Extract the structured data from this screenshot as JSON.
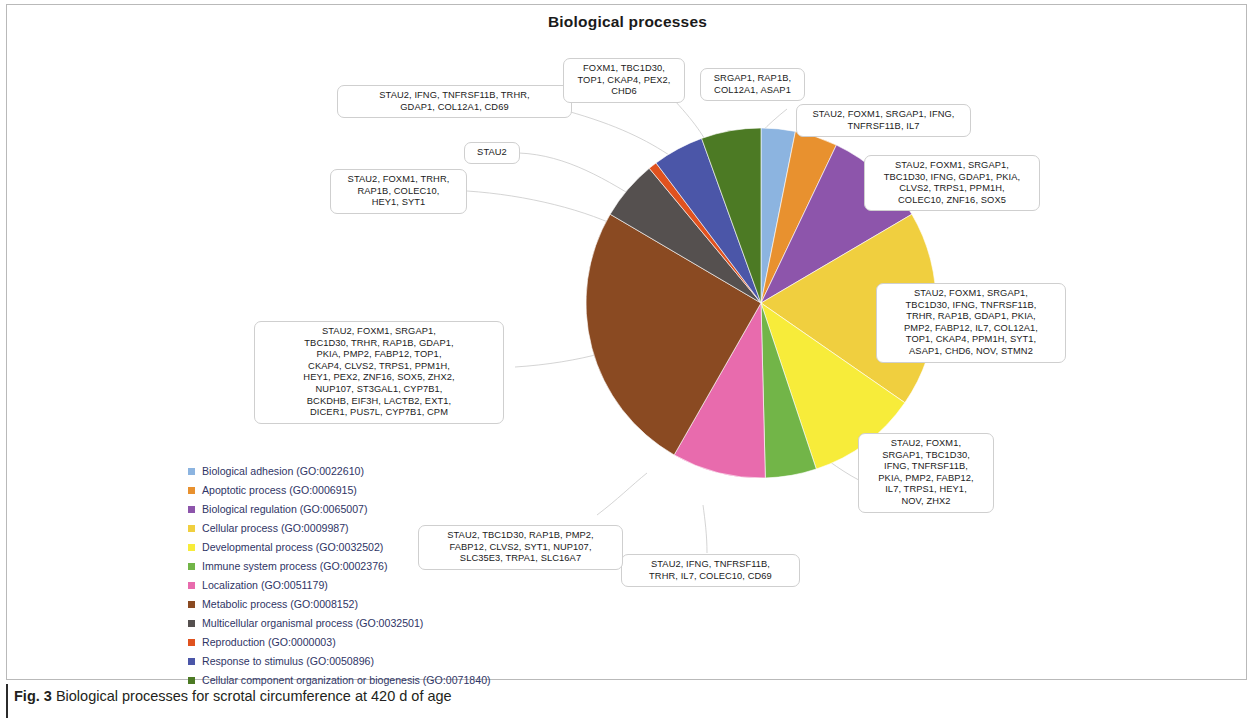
{
  "figure": {
    "title": "Biological processes",
    "caption_prefix": "Fig. 3",
    "caption_text": " Biological processes for scrotal circumference at 420 d of age"
  },
  "legend": [
    {
      "label": "Biological adhesion (GO:0022610)",
      "color": "#8cb4e0"
    },
    {
      "label": "Apoptotic process (GO:0006915)",
      "color": "#e8912f"
    },
    {
      "label": "Biological regulation (GO:0065007)",
      "color": "#8d55ab"
    },
    {
      "label": "Cellular process (GO:0009987)",
      "color": "#f0cf3f"
    },
    {
      "label": "Developmental process (GO:0032502)",
      "color": "#f7ec3a"
    },
    {
      "label": "Immune system process (GO:0002376)",
      "color": "#72b548"
    },
    {
      "label": "Localization (GO:0051179)",
      "color": "#e86bad"
    },
    {
      "label": "Metabolic process (GO:0008152)",
      "color": "#8a4a22"
    },
    {
      "label": "Multicellular organismal process (GO:0032501)",
      "color": "#55504f"
    },
    {
      "label": "Reproduction (GO:0000003)",
      "color": "#e0521f"
    },
    {
      "label": "Response to stimulus (GO:0050896)",
      "color": "#4b56a8"
    },
    {
      "label": "Cellular component organization or biogenesis (GO:0071840)",
      "color": "#4c7a24"
    }
  ],
  "chart_data": {
    "type": "pie",
    "title": "Biological processes",
    "legend_position": "bottom-left",
    "categories": [
      "Biological adhesion (GO:0022610)",
      "Apoptotic process (GO:0006915)",
      "Biological regulation (GO:0065007)",
      "Cellular process (GO:0009987)",
      "Developmental process (GO:0032502)",
      "Immune system process (GO:0002376)",
      "Localization (GO:0051179)",
      "Metabolic process (GO:0008152)",
      "Multicellular organismal process (GO:0032501)",
      "Reproduction (GO:0000003)",
      "Response to stimulus (GO:0050896)",
      "Cellular component organization or biogenesis (GO:0071840)"
    ],
    "colors": [
      "#8cb4e0",
      "#e8912f",
      "#8d55ab",
      "#f0cf3f",
      "#f7ec3a",
      "#72b548",
      "#e86bad",
      "#8a4a22",
      "#55504f",
      "#e0521f",
      "#4b56a8",
      "#4c7a24"
    ],
    "values": [
      4,
      5,
      12,
      23,
      13,
      6,
      11,
      32,
      7,
      1,
      6,
      7
    ],
    "gene_counts": [
      4,
      5,
      6,
      12,
      26,
      6,
      13,
      11,
      32,
      7,
      1,
      7
    ],
    "units": "gene count",
    "grid": false
  },
  "callouts": [
    {
      "id": "cellular-component-organization",
      "category": "Cellular component organization or biogenesis (GO:0071840)",
      "text": "STAU2, IFNG, TNFRSF11B, TRHR,\nGDAP1, COL12A1, CD69"
    },
    {
      "id": "response-to-stimulus",
      "category": "Response to stimulus (GO:0050896)",
      "text": "FOXM1, TBC1D30,\nTOP1, CKAP4, PEX2,\nCHD6"
    },
    {
      "id": "reproduction",
      "category": "Reproduction (GO:0000003)",
      "text": "STAU2"
    },
    {
      "id": "multicellular-organismal",
      "category": "Multicellular organismal process (GO:0032501)",
      "text": "STAU2, FOXM1, TRHR,\nRAP1B, COLEC10,\nHEY1, SYT1"
    },
    {
      "id": "biological-adhesion",
      "category": "Biological adhesion (GO:0022610)",
      "text": "SRGAP1, RAP1B,\nCOL12A1, ASAP1"
    },
    {
      "id": "apoptotic-process",
      "category": "Apoptotic process (GO:0006915)",
      "text": "STAU2, FOXM1, SRGAP1, IFNG,\nTNFRSF11B, IL7"
    },
    {
      "id": "biological-regulation",
      "category": "Biological regulation (GO:0065007)",
      "text": "STAU2, FOXM1, SRGAP1,\nTBC1D30, IFNG, GDAP1, PKIA,\nCLVS2, TRPS1, PPM1H,\nCOLEC10, ZNF16, SOX5"
    },
    {
      "id": "cellular-process",
      "category": "Cellular process (GO:0009987)",
      "text": "STAU2, FOXM1, SRGAP1,\nTBC1D30, IFNG, TNFRSF11B,\nTRHR, RAP1B, GDAP1, PKIA,\nPMP2, FABP12, IL7, COL12A1,\nTOP1, CKAP4, PPM1H, SYT1,\nASAP1, CHD6, NOV, STMN2"
    },
    {
      "id": "developmental-process",
      "category": "Developmental process (GO:0032502)",
      "text": "STAU2, FOXM1,\nSRGAP1, TBC1D30,\nIFNG, TNFRSF11B,\nPKIA, PMP2, FABP12,\nIL7, TRPS1, HEY1,\nNOV, ZHX2"
    },
    {
      "id": "immune-system-process",
      "category": "Immune system process (GO:0002376)",
      "text": "STAU2, IFNG, TNFRSF11B,\nTRHR, IL7, COLEC10, CD69"
    },
    {
      "id": "localization",
      "category": "Localization (GO:0051179)",
      "text": "STAU2, TBC1D30, RAP1B, PMP2,\nFABP12, CLVS2, SYT1, NUP107,\nSLC35E3, TRPA1, SLC16A7"
    },
    {
      "id": "metabolic-process",
      "category": "Metabolic process (GO:0008152)",
      "text": "STAU2, FOXM1, SRGAP1,\nTBC1D30, TRHR, RAP1B, GDAP1,\nPKIA, PMP2, FABP12, TOP1,\nCKAP4, CLVS2, TRPS1, PPM1H,\nHEY1, PEX2, ZNF16, SOX5, ZHX2,\nNUP107, ST3GAL1, CYP7B1,\nBCKDHB, EIF3H, LACTB2, EXT1,\nDICER1, PUS7L, CYP7B1, CPM"
    }
  ]
}
